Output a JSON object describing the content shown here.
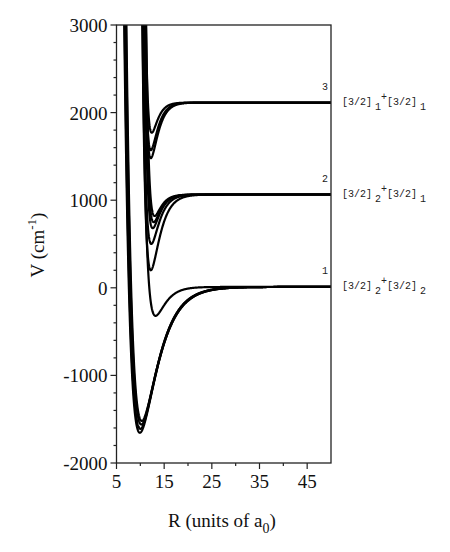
{
  "chart_data": {
    "type": "line",
    "title": "",
    "xlabel": "R (units of a",
    "xlabel_subscript": "0",
    "xlabel_suffix": ")",
    "ylabel": "V (cm",
    "ylabel_superscript": "-1",
    "ylabel_suffix": ")",
    "xlim": [
      5,
      50
    ],
    "ylim": [
      -2000,
      3000
    ],
    "x_ticks": [
      5,
      15,
      25,
      35,
      45
    ],
    "x_tick_labels": [
      "5",
      "15",
      "25",
      "35",
      "45"
    ],
    "x_minor_ticks": [
      10,
      20,
      30,
      40
    ],
    "y_ticks": [
      3000,
      2000,
      1000,
      0,
      -1000,
      -2000
    ],
    "y_tick_labels": [
      "3000",
      "2000",
      "1000",
      "0",
      "-1000",
      "-2000"
    ],
    "y_minor_step": 200,
    "grid": false,
    "legend": "none",
    "asymptotes": [
      {
        "id": "1",
        "value": 10,
        "label_main_a": "[3/2]",
        "sub_a": "2",
        "label_plus": "+",
        "label_main_b": "[3/2]",
        "sub_b": "2"
      },
      {
        "id": "2",
        "value": 1065,
        "label_main_a": "[3/2]",
        "sub_a": "2",
        "label_plus": "+",
        "label_main_b": "[3/2]",
        "sub_b": "1"
      },
      {
        "id": "3",
        "value": 2115,
        "label_main_a": "[3/2]",
        "sub_a": "1",
        "label_plus": "+",
        "label_main_b": "[3/2]",
        "sub_b": "1"
      }
    ],
    "series": [
      {
        "name": "asym1-deep-a",
        "asymptote": 10,
        "v_min": -1655,
        "r_min": 9.9,
        "a": 0.3
      },
      {
        "name": "asym1-deep-b",
        "asymptote": 10,
        "v_min": -1610,
        "r_min": 10.0,
        "a": 0.3
      },
      {
        "name": "asym1-deep-c",
        "asymptote": 10,
        "v_min": -1560,
        "r_min": 10.2,
        "a": 0.31
      },
      {
        "name": "asym1-deep-d",
        "asymptote": 10,
        "v_min": -1520,
        "r_min": 10.3,
        "a": 0.31
      },
      {
        "name": "asym1-shallow",
        "asymptote": 10,
        "v_min": -320,
        "r_min": 13.2,
        "a": 0.52
      },
      {
        "name": "asym2-a",
        "asymptote": 1065,
        "v_min": 200,
        "r_min": 12.2,
        "a": 0.58
      },
      {
        "name": "asym2-b",
        "asymptote": 1065,
        "v_min": 500,
        "r_min": 12.3,
        "a": 0.65
      },
      {
        "name": "asym2-c",
        "asymptote": 1065,
        "v_min": 680,
        "r_min": 12.6,
        "a": 0.72
      },
      {
        "name": "asym2-d",
        "asymptote": 1065,
        "v_min": 750,
        "r_min": 12.8,
        "a": 0.74
      },
      {
        "name": "asym2-e",
        "asymptote": 1065,
        "v_min": 820,
        "r_min": 13.0,
        "a": 0.78
      },
      {
        "name": "asym3-a",
        "asymptote": 2115,
        "v_min": 1480,
        "r_min": 12.2,
        "a": 0.72
      },
      {
        "name": "asym3-b",
        "asymptote": 2115,
        "v_min": 1570,
        "r_min": 12.2,
        "a": 0.76
      },
      {
        "name": "asym3-c",
        "asymptote": 2115,
        "v_min": 1770,
        "r_min": 12.4,
        "a": 0.86
      }
    ]
  }
}
